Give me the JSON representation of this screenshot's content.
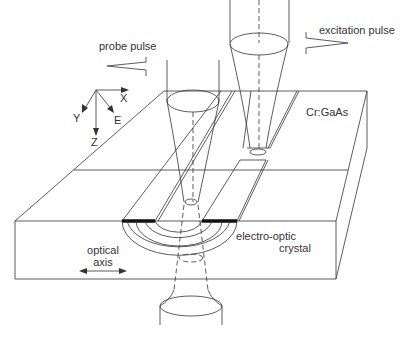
{
  "diagram": {
    "labels": {
      "probe_pulse": "probe pulse",
      "excitation_pulse": "excitation pulse",
      "substrate": "Cr:GaAs",
      "crystal_line1": "electro-optic",
      "crystal_line2": "crystal",
      "optical_axis_line1": "optical",
      "optical_axis_line2": "axis"
    },
    "axes": {
      "x": "X",
      "y": "Y",
      "z": "Z",
      "e": "E"
    },
    "colors": {
      "line": "#333333",
      "electrode": "#111111",
      "background": "#ffffff"
    }
  }
}
